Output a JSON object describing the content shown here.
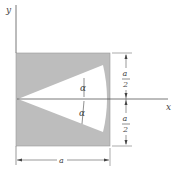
{
  "figure": {
    "axes": {
      "x_label": "x",
      "y_label": "y"
    },
    "plate": {
      "fill": "#bdbdbd",
      "cutout_fill": "#ffffff",
      "shape": "square with circular-sector cutout"
    },
    "angles": {
      "upper": "α",
      "lower": "α"
    },
    "dimensions": {
      "width": "a",
      "upper_half": {
        "num": "a",
        "den": "2"
      },
      "lower_half": {
        "num": "a",
        "den": "2"
      }
    }
  }
}
